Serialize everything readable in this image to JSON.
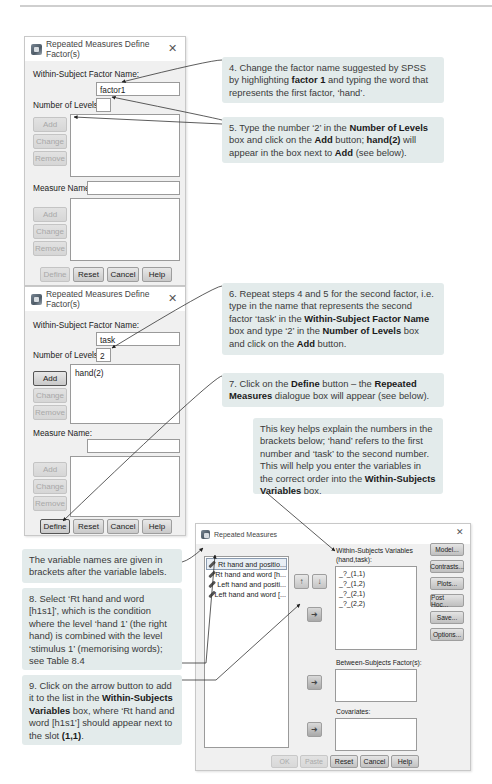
{
  "dialog1": {
    "title": "Repeated Measures Define Factor(s)",
    "factor_name_label": "Within-Subject Factor Name:",
    "factor_name_value": "factor1",
    "levels_label": "Number of Levels:",
    "levels_value": "",
    "factor_list": [],
    "buttons_factor": [
      "Add",
      "Change",
      "Remove"
    ],
    "measure_label": "Measure Name:",
    "measure_value": "",
    "buttons_measure": [
      "Add",
      "Change",
      "Remove"
    ],
    "footer_buttons": [
      "Define",
      "Reset",
      "Cancel",
      "Help"
    ]
  },
  "dialog2": {
    "title": "Repeated Measures Define Factor(s)",
    "factor_name_label": "Within-Subject Factor Name:",
    "factor_name_value": "task",
    "levels_label": "Number of Levels:",
    "levels_value": "2",
    "factor_list": [
      "hand(2)"
    ],
    "buttons_factor": [
      "Add",
      "Change",
      "Remove"
    ],
    "measure_label": "Measure Name:",
    "measure_value": "",
    "buttons_measure": [
      "Add",
      "Change",
      "Remove"
    ],
    "footer_buttons": [
      "Define",
      "Reset",
      "Cancel",
      "Help"
    ]
  },
  "dialog3": {
    "title": "Repeated Measures",
    "variables": [
      "Rt hand and positio...",
      "Rt hand and word [h...",
      "Left hand and positi...",
      "Left hand and word [..."
    ],
    "within_label": "Within-Subjects Variables",
    "within_sublabel": "(hand,task):",
    "within_slots": [
      "_?_(1,1)",
      "_?_(1,2)",
      "_?_(2,1)",
      "_?_(2,2)"
    ],
    "between_label": "Between-Subjects Factor(s):",
    "covariates_label": "Covariates:",
    "side_buttons": [
      "Model...",
      "Contrasts...",
      "Plots...",
      "Post Hoc...",
      "Save...",
      "Options..."
    ],
    "footer_buttons": [
      "OK",
      "Paste",
      "Reset",
      "Cancel",
      "Help"
    ],
    "up_arrow": "↑",
    "down_arrow": "↓",
    "move_arrow": "➜"
  },
  "callouts": {
    "step4": {
      "pre": "4. Change the factor name suggested by SPSS by highlighting ",
      "b1": "factor 1",
      "post": " and typing the word that represents the first factor, ‘hand’."
    },
    "step5": {
      "pre": "5. Type the number ‘2’ in the ",
      "b1": "Number of Levels",
      "mid1": " box and click on the ",
      "b2": "Add",
      "mid2": " button; ",
      "b3": "hand(2)",
      "mid3": " will appear in the box next to ",
      "b4": "Add",
      "post": " (see below)."
    },
    "step6": {
      "pre": "6. Repeat steps 4 and 5 for the second factor, i.e. type in the name that represents the second factor ‘task’ in the ",
      "b1": "Within-Subject Factor Name",
      "mid1": " box and type ‘2’ in the ",
      "b2": "Number of Levels",
      "mid2": " box and click on the ",
      "b3": "Add",
      "post": " button."
    },
    "step7": {
      "pre": "7. Click on the ",
      "b1": "Define",
      "mid1": " button – the ",
      "b2": "Repeated Measures",
      "post": " dialogue box will appear (see below)."
    },
    "key": {
      "pre": "This key helps explain the numbers in the brackets below; ‘hand’ refers to the first number and ‘task’ to the second number. This will help you enter the variables in the correct order into the ",
      "b1": "Within-Subjects Variables",
      "post": " box."
    },
    "varnames": {
      "text": "The variable names are given in brackets after the variable labels."
    },
    "step8": {
      "text": "8. Select ‘Rt hand and word [h1s1]’, which is the condition where the level ‘hand 1’ (the right hand) is combined with the level ‘stimulus 1’ (memorising words); see Table 8.4"
    },
    "step9": {
      "pre": "9. Click on the arrow button to add it to the list in the ",
      "b1": "Within-Subjects Variables",
      "mid1": " box, where ‘Rt hand and word [h1s1’] should appear next to the slot ",
      "b2": "(1,1)",
      "post": "."
    }
  }
}
